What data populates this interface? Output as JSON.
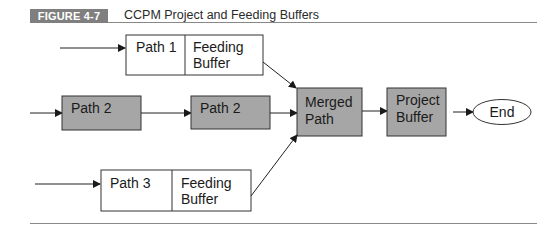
{
  "figure": {
    "label": "FIGURE 4-7",
    "title": "CCPM Project and Feeding Buffers"
  },
  "diagram": {
    "colors": {
      "shaded_fill": "#a6a6a6",
      "plain_fill": "#ffffff",
      "stroke": "#333333",
      "label_bg": "#7f7f7f"
    },
    "nodes": {
      "path1": {
        "label": "Path 1"
      },
      "path1_buffer": {
        "line1": "Feeding",
        "line2": "Buffer"
      },
      "path2a": {
        "label": "Path 2"
      },
      "path2b": {
        "label": "Path 2"
      },
      "merged": {
        "line1": "Merged",
        "line2": "Path"
      },
      "project_buffer": {
        "line1": "Project",
        "line2": "Buffer"
      },
      "end": {
        "label": "End"
      },
      "path3": {
        "label": "Path 3"
      },
      "path3_buffer": {
        "line1": "Feeding",
        "line2": "Buffer"
      }
    }
  }
}
